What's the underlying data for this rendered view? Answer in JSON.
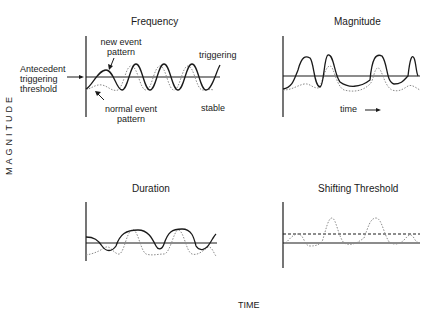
{
  "figure": {
    "y_axis_label": "MAGNITUDE",
    "x_axis_label": "TIME"
  },
  "panels": {
    "frequency": {
      "title": "Frequency",
      "annotations": {
        "new_event": [
          "new event",
          "pattern"
        ],
        "normal_event": [
          "normal event",
          "pattern"
        ],
        "threshold": [
          "Antecedent",
          "triggering",
          "threshold"
        ],
        "triggering": "triggering",
        "stable": "stable"
      }
    },
    "magnitude": {
      "title": "Magnitude",
      "time_label": "time"
    },
    "duration": {
      "title": "Duration"
    },
    "shifting_threshold": {
      "title": "Shifting Threshold"
    }
  },
  "legend": {
    "solid_curve": "new event pattern",
    "dotted_curve": "normal event pattern",
    "horizontal_line": "antecedent triggering threshold",
    "dashed_line": "shifted threshold"
  },
  "colors": {
    "ink": "#1a1a1a",
    "dotted": "#8a8a8a"
  }
}
